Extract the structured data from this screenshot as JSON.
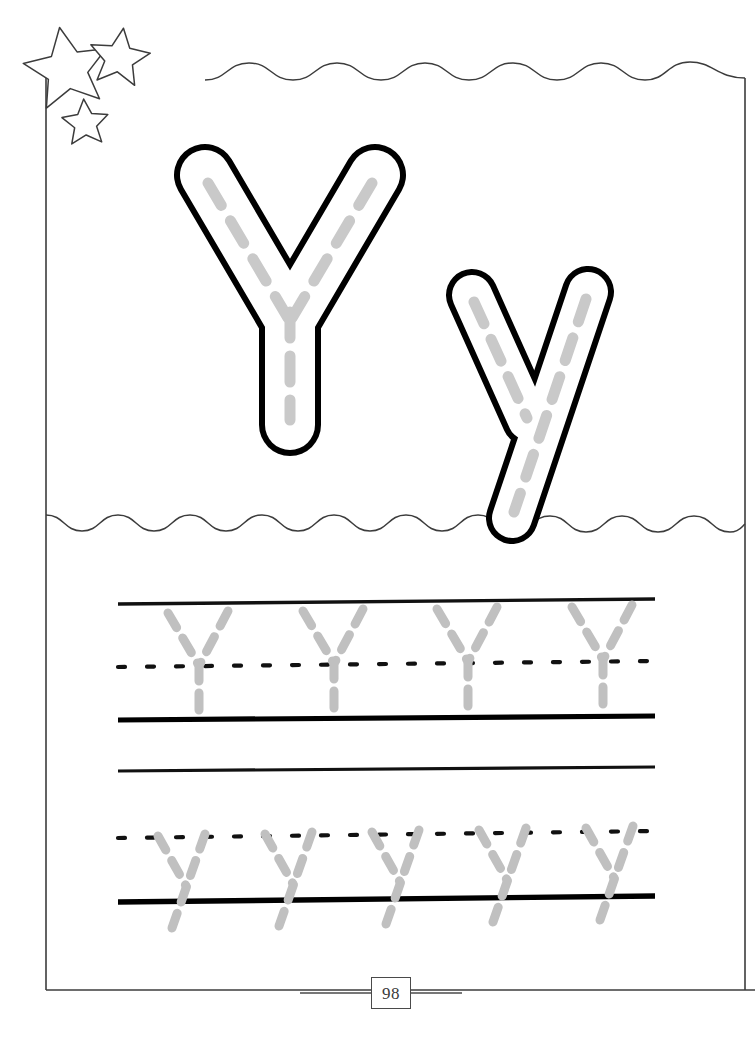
{
  "worksheet": {
    "kind": "handwriting-tracing-worksheet",
    "letter_upper": "Y",
    "letter_lower": "y",
    "page_number": "98",
    "colors": {
      "ink": "#000000",
      "frame": "#3c3c3c",
      "trace_gray": "#c9c9c9",
      "paper": "#ffffff",
      "page_number_text": "#3a3a3a"
    },
    "decorations": {
      "stars": [
        {
          "name": "star-large",
          "cx": 66,
          "cy": 64,
          "r": 37,
          "rotation": -12
        },
        {
          "name": "star-medium",
          "cx": 120,
          "cy": 53,
          "r": 26,
          "rotation": 8
        },
        {
          "name": "star-small",
          "cx": 85,
          "cy": 118,
          "r": 21,
          "rotation": -4
        }
      ],
      "wavy_dividers": [
        {
          "name": "top-wave",
          "y": 72,
          "amplitude": 9,
          "period": 89
        },
        {
          "name": "middle-wave",
          "y": 519,
          "amplitude": 8,
          "period": 71
        }
      ]
    },
    "frame": {
      "left": 46,
      "top": 56,
      "right": 745,
      "bottom": 990
    },
    "showcase": {
      "uppercase": {
        "label": "Y",
        "x": 170,
        "y": 145,
        "width": 240,
        "height": 320
      },
      "lowercase": {
        "label": "y",
        "x": 440,
        "y": 262,
        "width": 180,
        "height": 280
      }
    },
    "practice_rows": [
      {
        "name": "uppercase-practice-row",
        "letter": "Y",
        "case": "uppercase",
        "top_line_y": 603,
        "mid_dotted_y": 664,
        "base_line_y": 719,
        "count": 4,
        "letter_x_positions": [
          197,
          332,
          466,
          601
        ]
      },
      {
        "name": "lowercase-practice-row",
        "letter": "y",
        "case": "lowercase",
        "top_line_y": 770,
        "mid_dotted_y": 836,
        "base_line_y": 900,
        "count": 5,
        "letter_x_positions": [
          178,
          285,
          392,
          499,
          606
        ]
      }
    ]
  }
}
